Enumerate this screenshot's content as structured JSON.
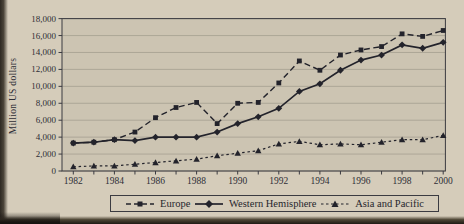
{
  "chart_data": {
    "type": "line",
    "title": "",
    "xlabel": "",
    "ylabel": "Million US dollars",
    "x": [
      1982,
      1983,
      1984,
      1985,
      1986,
      1987,
      1988,
      1989,
      1990,
      1991,
      1992,
      1993,
      1994,
      1995,
      1996,
      1997,
      1998,
      1999,
      2000
    ],
    "x_labels": [
      "1982",
      "1984",
      "1986",
      "1988",
      "1990",
      "1992",
      "1994",
      "1996",
      "1998",
      "2000"
    ],
    "ylim": [
      0,
      18000
    ],
    "ytick_step": 2000,
    "y_tick_labels": [
      "0",
      "2,000",
      "4,000",
      "6,000",
      "8,000",
      "10,000",
      "12,000",
      "14,000",
      "16,000",
      "18,000"
    ],
    "grid": "horizontal",
    "legend_position": "bottom",
    "series": [
      {
        "name": "Europe",
        "style": "dashed",
        "marker": "square",
        "values": [
          3300,
          3400,
          3700,
          4600,
          6300,
          7500,
          8100,
          5600,
          8000,
          8100,
          10400,
          13000,
          11900,
          13700,
          14300,
          14700,
          16200,
          15900,
          16600
        ]
      },
      {
        "name": "Western Hemisphere",
        "style": "solid",
        "marker": "diamond",
        "values": [
          3300,
          3400,
          3700,
          3600,
          4000,
          4000,
          4000,
          4600,
          5600,
          6400,
          7400,
          9400,
          10300,
          11900,
          13100,
          13700,
          14900,
          14500,
          15200
        ]
      },
      {
        "name": "Asia and Pacific",
        "style": "dotted",
        "marker": "triangle",
        "values": [
          500,
          600,
          600,
          800,
          1000,
          1200,
          1400,
          1800,
          2100,
          2400,
          3200,
          3500,
          3100,
          3200,
          3100,
          3400,
          3700,
          3700,
          4200
        ]
      }
    ],
    "colors": {
      "ink": "#23232b",
      "text": "#2e2e36",
      "paper": "#d5ccba",
      "plot_bg": "#ccc4b2",
      "grid": "#a59f91",
      "frame": "#3b3b41"
    }
  }
}
